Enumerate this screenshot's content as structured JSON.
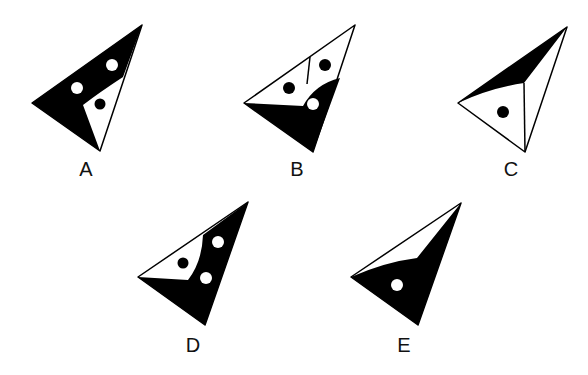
{
  "colors": {
    "fill": "#000000",
    "background": "#ffffff",
    "stroke": "#000000"
  },
  "figures": [
    {
      "label": "A",
      "label_pos": [
        86,
        169
      ],
      "description": "triangle, mostly black with white notch, two white circles, one black dot"
    },
    {
      "label": "B",
      "label_pos": [
        297,
        169
      ],
      "description": "triangle, lower black region, upper white split by a line, two black dots, one white circle"
    },
    {
      "label": "C",
      "label_pos": [
        511,
        169
      ],
      "description": "triangle, thin black sliver on top, white lower region with one black dot"
    },
    {
      "label": "D",
      "label_pos": [
        193,
        345
      ],
      "description": "triangle, mostly black, white wedge on left with one black dot, two white circles"
    },
    {
      "label": "E",
      "label_pos": [
        404,
        345
      ],
      "description": "triangle, mostly black, thin white sliver on top, one white circle"
    }
  ]
}
